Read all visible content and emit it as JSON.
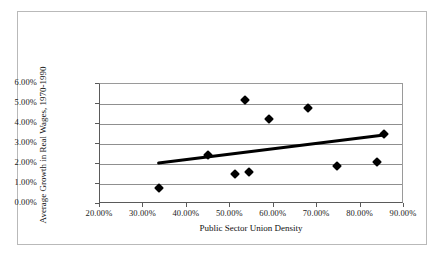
{
  "chart_data": {
    "type": "scatter",
    "title": "",
    "xlabel": "Public Sector Union Density",
    "ylabel": "Average Growth in Real Wages, 1970-1990",
    "xlim": [
      20,
      90
    ],
    "ylim": [
      0,
      6
    ],
    "grid": true,
    "legend": false,
    "x_tick_labels": [
      "20.00%",
      "30.00%",
      "40.00%",
      "50.00%",
      "60.00%",
      "70.00%",
      "80.00%",
      "90.00%"
    ],
    "x_tick_values": [
      20,
      30,
      40,
      50,
      60,
      70,
      80,
      90
    ],
    "y_tick_labels": [
      "0.00%",
      "1.00%",
      "2.00%",
      "3.00%",
      "4.00%",
      "5.00%",
      "6.00%"
    ],
    "y_tick_values": [
      0,
      1,
      2,
      3,
      4,
      5,
      6
    ],
    "points": [
      {
        "x": 33.5,
        "y": 0.8
      },
      {
        "x": 44.9,
        "y": 2.45
      },
      {
        "x": 51.1,
        "y": 1.5
      },
      {
        "x": 54.3,
        "y": 1.6
      },
      {
        "x": 53.4,
        "y": 5.2
      },
      {
        "x": 58.9,
        "y": 4.25
      },
      {
        "x": 67.9,
        "y": 4.8
      },
      {
        "x": 74.6,
        "y": 1.9
      },
      {
        "x": 83.8,
        "y": 2.1
      },
      {
        "x": 85.4,
        "y": 3.5
      }
    ],
    "trendline": {
      "type": "linear",
      "x_start": 33.5,
      "y_start": 2.05,
      "x_end": 85.4,
      "y_end": 3.45
    },
    "marker_color": "#000000",
    "trendline_color": "#000000",
    "grid_color": "#8f8f8f",
    "axis_color": "#5a5a5a"
  }
}
